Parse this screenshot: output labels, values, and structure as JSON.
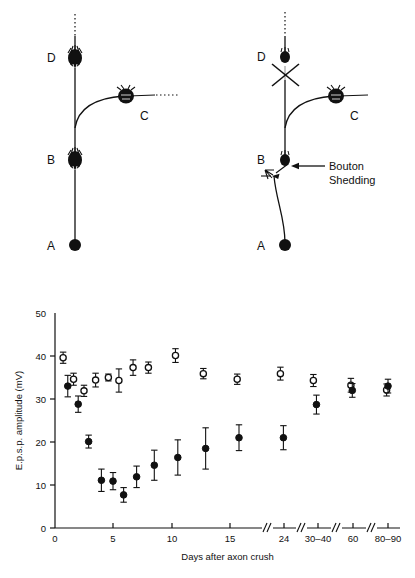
{
  "figure": {
    "panel_top": {
      "name": "synaptic-circuit-diagram",
      "left_diagram": {
        "caption": "control",
        "nodes": [
          {
            "id": "A",
            "label": "A",
            "type": "filled-soma"
          },
          {
            "id": "B",
            "label": "B",
            "type": "bouton-cluster"
          },
          {
            "id": "C",
            "label": "C",
            "type": "bouton-cluster"
          },
          {
            "id": "D",
            "label": "D",
            "type": "bouton-cluster"
          }
        ]
      },
      "right_diagram": {
        "caption": "after axon crush",
        "nodes": [
          {
            "id": "A",
            "label": "A",
            "type": "filled-soma"
          },
          {
            "id": "B",
            "label": "B",
            "type": "bouton-cluster"
          },
          {
            "id": "C",
            "label": "C",
            "type": "bouton-cluster"
          },
          {
            "id": "D",
            "label": "D",
            "type": "bouton-cluster"
          }
        ],
        "annotations": [
          {
            "name": "axon-crush-marker",
            "label": "X"
          },
          {
            "name": "bouton-shedding-label",
            "line1": "Bouton",
            "line2": "Shedding"
          }
        ]
      }
    }
  },
  "chart_data": {
    "type": "scatter",
    "title": "",
    "xlabel": "Days after axon crush",
    "ylabel": "E.p.s.p. amplitude (mV)",
    "ylim": [
      0,
      50
    ],
    "yticks": [
      0,
      10,
      20,
      30,
      40,
      50
    ],
    "ytick_labels": [
      "0",
      "10",
      "20",
      "30",
      "40",
      "50"
    ],
    "xticks": [
      0,
      5,
      10,
      15,
      24,
      35,
      60,
      85
    ],
    "xtick_labels": [
      "0",
      "5",
      "10",
      "15",
      "24",
      "30–40",
      "60",
      "80–90"
    ],
    "axis_breaks": [
      "between 15 and 24",
      "between 24 and 30–40",
      "between 30–40 and 60",
      "between 60 and 80–90"
    ],
    "grid": false,
    "legend_position": "none",
    "error_bars": "mean ± s.e.m.",
    "series": [
      {
        "name": "open-circles",
        "marker": "open circle",
        "points": [
          {
            "x": 0.7,
            "y": 39.6,
            "err_low": 1.3,
            "err_high": 1.3
          },
          {
            "x": 1.6,
            "y": 34.6,
            "err_low": 1.4,
            "err_high": 1.4
          },
          {
            "x": 2.5,
            "y": 31.9,
            "err_low": 1.3,
            "err_high": 1.3
          },
          {
            "x": 3.5,
            "y": 34.4,
            "err_low": 1.6,
            "err_high": 1.6
          },
          {
            "x": 4.6,
            "y": 35.0,
            "err_low": 0.8,
            "err_high": 0.8
          },
          {
            "x": 5.5,
            "y": 34.3,
            "err_low": 2.7,
            "err_high": 2.7
          },
          {
            "x": 6.7,
            "y": 37.3,
            "err_low": 1.8,
            "err_high": 1.8
          },
          {
            "x": 8.0,
            "y": 37.3,
            "err_low": 1.3,
            "err_high": 1.3
          },
          {
            "x": 10.3,
            "y": 40.1,
            "err_low": 1.6,
            "err_high": 1.6
          },
          {
            "x": 12.7,
            "y": 35.9,
            "err_low": 1.2,
            "err_high": 1.2
          },
          {
            "x": 16.2,
            "y": 34.6,
            "err_low": 1.2,
            "err_high": 1.2
          },
          {
            "x": 23.4,
            "y": 35.9,
            "err_low": 1.5,
            "err_high": 1.5
          },
          {
            "x": 33.5,
            "y": 34.3,
            "err_low": 1.4,
            "err_high": 1.4
          },
          {
            "x": 58.5,
            "y": 33.2,
            "err_low": 1.6,
            "err_high": 1.6
          },
          {
            "x": 84.0,
            "y": 32.1,
            "err_low": 1.4,
            "err_high": 1.4
          }
        ]
      },
      {
        "name": "filled-circles",
        "marker": "filled circle",
        "points": [
          {
            "x": 1.1,
            "y": 33.0,
            "err_low": 2.5,
            "err_high": 2.5
          },
          {
            "x": 2.0,
            "y": 28.8,
            "err_low": 1.9,
            "err_high": 1.9
          },
          {
            "x": 2.9,
            "y": 20.1,
            "err_low": 1.5,
            "err_high": 1.5
          },
          {
            "x": 4.0,
            "y": 11.1,
            "err_low": 2.6,
            "err_high": 2.6
          },
          {
            "x": 5.0,
            "y": 10.9,
            "err_low": 2.0,
            "err_high": 2.0
          },
          {
            "x": 5.9,
            "y": 7.7,
            "err_low": 1.7,
            "err_high": 1.7
          },
          {
            "x": 7.0,
            "y": 11.9,
            "err_low": 2.5,
            "err_high": 2.5
          },
          {
            "x": 8.5,
            "y": 14.6,
            "err_low": 3.5,
            "err_high": 3.5
          },
          {
            "x": 10.5,
            "y": 16.4,
            "err_low": 4.1,
            "err_high": 4.1
          },
          {
            "x": 12.9,
            "y": 18.5,
            "err_low": 4.8,
            "err_high": 4.8
          },
          {
            "x": 16.5,
            "y": 21.0,
            "err_low": 3.0,
            "err_high": 3.0
          },
          {
            "x": 23.9,
            "y": 21.0,
            "err_low": 2.8,
            "err_high": 2.8
          },
          {
            "x": 34.5,
            "y": 28.7,
            "err_low": 2.2,
            "err_high": 2.2
          },
          {
            "x": 59.5,
            "y": 32.0,
            "err_low": 1.6,
            "err_high": 1.6
          },
          {
            "x": 85.0,
            "y": 33.0,
            "err_low": 1.6,
            "err_high": 1.6
          }
        ]
      }
    ]
  }
}
